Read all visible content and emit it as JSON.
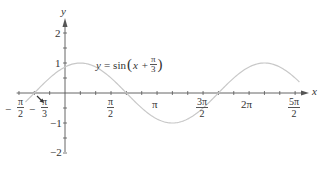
{
  "chart_data": {
    "type": "line",
    "title": "",
    "function_label": {
      "lhs": "y",
      "equals": "=",
      "func": "sin",
      "var": "x",
      "plus": "+",
      "num": "π",
      "den": "3"
    },
    "xlabel": "x",
    "ylabel": "y",
    "xlim": [
      -1.65,
      8.45
    ],
    "ylim": [
      -2.3,
      2.5
    ],
    "grid": false,
    "legend": null,
    "x_ticks": [
      {
        "value": -1.5708,
        "neg": "−",
        "num": "π",
        "den": "2"
      },
      {
        "value": -1.0472,
        "neg": "−",
        "num": "π",
        "den": "3"
      },
      {
        "value": 1.5708,
        "num": "π",
        "den": "2"
      },
      {
        "value": 3.1416,
        "label": "π"
      },
      {
        "value": 4.7124,
        "num": "3π",
        "den": "2"
      },
      {
        "value": 6.2832,
        "label": "2π"
      },
      {
        "value": 7.854,
        "num": "5π",
        "den": "2"
      }
    ],
    "y_ticks": [
      {
        "value": 2,
        "label": "2"
      },
      {
        "value": 1,
        "label": "1"
      },
      {
        "value": -1,
        "label": "−1"
      },
      {
        "value": -2,
        "label": "−2"
      }
    ],
    "series": [
      {
        "name": "y = sin(x + π/3)",
        "color": "#c8c8c8",
        "x": [
          -1.8,
          -1.5708,
          -1.0472,
          -0.5236,
          0,
          0.5236,
          1.0472,
          1.5708,
          2.0944,
          2.618,
          3.1416,
          3.6652,
          4.1888,
          4.7124,
          5.236,
          5.7596,
          6.2832,
          6.8068,
          7.3304,
          7.854,
          8.1
        ],
        "values": [
          -0.714,
          -0.5,
          0,
          0.5,
          0.866,
          1,
          0.866,
          0.5,
          0,
          -0.5,
          -0.866,
          -1,
          -0.866,
          -0.5,
          0,
          0.5,
          0.866,
          1,
          0.866,
          0.5,
          0.27
        ]
      }
    ],
    "annotations": [
      {
        "type": "arrow",
        "points_to": "x = -π/3 (zero crossing)"
      }
    ]
  },
  "colors": {
    "axis": "#555555",
    "curve": "#c8c8c8",
    "text": "#333333"
  }
}
